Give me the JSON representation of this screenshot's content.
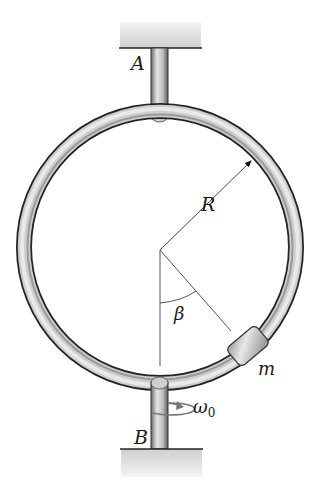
{
  "diagram": {
    "type": "mechanics",
    "labels": {
      "top_support": "A",
      "bottom_support": "B",
      "radius": "R",
      "angle": "β",
      "mass": "m",
      "angular_velocity": "ω",
      "angular_velocity_subscript": "0"
    },
    "colors": {
      "ring_dark": "#2a2a2a",
      "ring_light": "#d9d9d9",
      "support_fill": "#d6d6d6",
      "line": "#444444",
      "text": "#1a1a1a"
    }
  }
}
